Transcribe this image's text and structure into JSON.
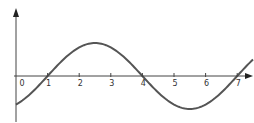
{
  "chart_data": {
    "type": "line",
    "title": "",
    "xlabel": "",
    "ylabel": "",
    "x_ticks": [
      "0",
      "1",
      "2",
      "3",
      "4",
      "5",
      "6",
      "7"
    ],
    "xlim": [
      0,
      7.5
    ],
    "ylim": [
      -1.4,
      2.1
    ],
    "grid": false,
    "legend": null,
    "series": [
      {
        "name": "sinusoid",
        "function": "y = sin(pi*(x-1)/3)",
        "x": [
          0,
          0.5,
          1,
          1.5,
          2,
          2.5,
          3,
          3.5,
          4,
          4.5,
          5,
          5.5,
          6,
          6.5,
          7,
          7.5
        ],
        "y": [
          -0.87,
          -0.5,
          0,
          0.5,
          0.87,
          1.0,
          0.87,
          0.5,
          0,
          -0.5,
          -0.87,
          -1.0,
          -0.87,
          -0.5,
          0,
          0.5
        ]
      }
    ],
    "zero_crossings": [
      1,
      4,
      7
    ],
    "maximum": {
      "x": 2.5,
      "y": 1.0
    },
    "minimum": {
      "x": 5.5,
      "y": -1.0
    },
    "colors": {
      "axis": "#444444",
      "curve": "#555555",
      "labels": "#333333"
    }
  }
}
